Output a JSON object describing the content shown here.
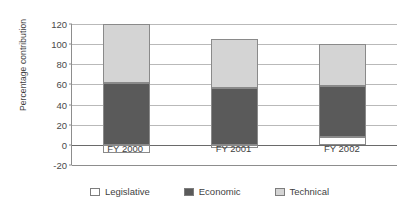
{
  "chart_data": {
    "type": "bar",
    "subtype": "stacked-bar",
    "title": "",
    "xlabel": "",
    "ylabel": "Percentage contribution",
    "categories": [
      "FY 2000",
      "FY 2001",
      "FY 2002"
    ],
    "series": [
      {
        "name": "Legislative",
        "color": "#ffffff",
        "values": [
          -8,
          -3,
          8
        ]
      },
      {
        "name": "Economic",
        "color": "#5a5a5a",
        "values": [
          61,
          56,
          50
        ]
      },
      {
        "name": "Technical",
        "color": "#d4d4d4",
        "values": [
          59,
          49,
          42
        ]
      }
    ],
    "stack_totals": [
      112,
      102,
      100
    ],
    "ylim": [
      -20,
      120
    ],
    "yticks": [
      120,
      100,
      80,
      60,
      40,
      20,
      0,
      -20
    ],
    "ytick_labels": [
      "120",
      "100",
      "80",
      "60",
      "40",
      "20",
      "0",
      "-20"
    ],
    "grid": true,
    "grid_axis": "y",
    "legend_position": "bottom",
    "legend_entries": [
      "Legislative",
      "Economic",
      "Technical"
    ]
  },
  "colors": {
    "legislative": "#ffffff",
    "economic": "#5a5a5a",
    "technical": "#d4d4d4",
    "gridline": "#b9b9b9",
    "axis": "#8d8d8d",
    "zero_line": "#6a6a6a",
    "text": "#3f3f3f",
    "background": "#ffffff"
  }
}
